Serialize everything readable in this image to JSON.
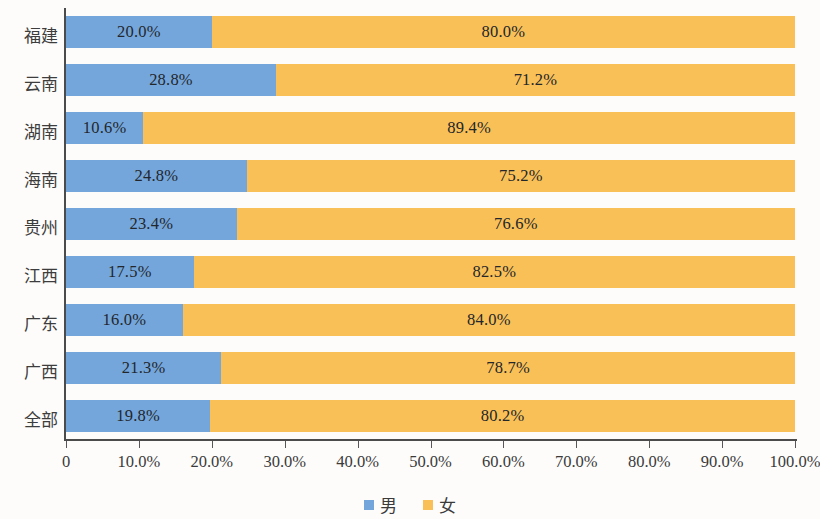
{
  "chart_data": {
    "type": "bar",
    "orientation": "horizontal",
    "stacked": true,
    "normalized": true,
    "title": "",
    "subtitle": "",
    "xlabel": "",
    "ylabel": "",
    "xlim": [
      0,
      100
    ],
    "grid": false,
    "legend_position": "bottom",
    "categories": [
      "福建",
      "云南",
      "湖南",
      "海南",
      "贵州",
      "江西",
      "广东",
      "广西",
      "全部"
    ],
    "tick_labels": [
      "0",
      "10.0%",
      "20.0%",
      "30.0%",
      "40.0%",
      "50.0%",
      "60.0%",
      "70.0%",
      "80.0%",
      "90.0%",
      "100.0%"
    ],
    "tick_values": [
      0,
      10,
      20,
      30,
      40,
      50,
      60,
      70,
      80,
      90,
      100
    ],
    "series": [
      {
        "name": "男",
        "color": "#74a6db",
        "values": [
          20.0,
          28.8,
          10.6,
          24.8,
          23.4,
          17.5,
          16.0,
          21.3,
          19.8
        ],
        "labels": [
          "20.0%",
          "28.8%",
          "10.6%",
          "24.8%",
          "23.4%",
          "17.5%",
          "16.0%",
          "21.3%",
          "19.8%"
        ]
      },
      {
        "name": "女",
        "color": "#f9c057",
        "values": [
          80.0,
          71.2,
          89.4,
          75.2,
          76.6,
          82.5,
          84.0,
          78.7,
          80.2
        ],
        "labels": [
          "80.0%",
          "71.2%",
          "89.4%",
          "75.2%",
          "76.6%",
          "82.5%",
          "84.0%",
          "78.7%",
          "80.2%"
        ]
      }
    ]
  },
  "legend": {
    "items": [
      {
        "label": "男",
        "color": "#74a6db",
        "swatch": "square-swatch-blue"
      },
      {
        "label": "女",
        "color": "#f9c057",
        "swatch": "square-swatch-orange"
      }
    ]
  }
}
